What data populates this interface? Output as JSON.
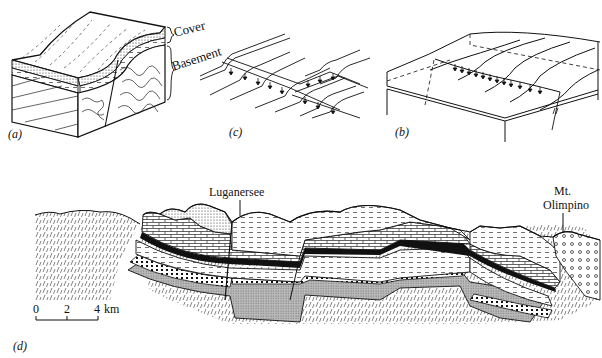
{
  "figure": {
    "panels": [
      {
        "id": "a",
        "label": "(a)",
        "title": "Cover and basement block"
      },
      {
        "id": "c",
        "label": "(c)",
        "title": "Stepped fault traces"
      },
      {
        "id": "b",
        "label": "(b)",
        "title": "Flexure block"
      },
      {
        "id": "d",
        "label": "(d)",
        "title": "Cross-section"
      }
    ],
    "panel_a": {
      "cover_label": "Cover",
      "basement_label": "Basement"
    },
    "panel_d": {
      "location_1": "Luganersee",
      "location_2_line1": "Mt.",
      "location_2_line2": "Olimpino",
      "scale": {
        "tick_0": "0",
        "tick_1": "2",
        "tick_2": "4",
        "unit": "km"
      }
    }
  }
}
